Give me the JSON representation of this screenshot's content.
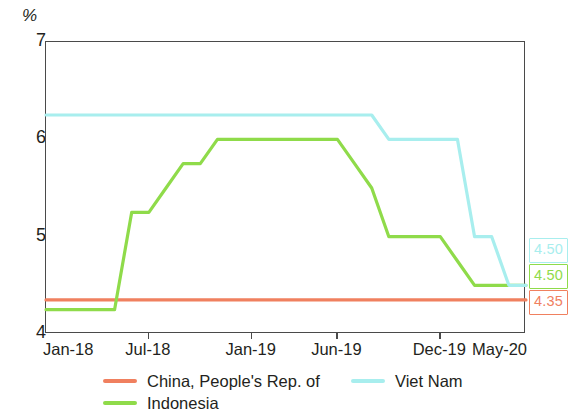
{
  "chart_data": {
    "type": "line",
    "title": "",
    "subtitle": "",
    "xlabel": "",
    "ylabel": "%",
    "unit_label": "%",
    "ylim": [
      4,
      7
    ],
    "yticks": [
      4,
      5,
      6,
      7
    ],
    "ytick_labels": [
      "4",
      "5",
      "6",
      "7"
    ],
    "grid": false,
    "legend_position": "bottom",
    "x": [
      "Jan-18",
      "Feb-18",
      "Mar-18",
      "Apr-18",
      "May-18",
      "Jun-18",
      "Jul-18",
      "Aug-18",
      "Sep-18",
      "Oct-18",
      "Nov-18",
      "Dec-18",
      "Jan-19",
      "Feb-19",
      "Mar-19",
      "Apr-19",
      "May-19",
      "Jun-19",
      "Jul-19",
      "Aug-19",
      "Sep-19",
      "Oct-19",
      "Nov-19",
      "Dec-19",
      "Jan-20",
      "Feb-20",
      "Mar-20",
      "Apr-20",
      "May-20"
    ],
    "xticks": [
      "Jan-18",
      "Jul-18",
      "Jan-19",
      "Jun-19",
      "Dec-19",
      "May-20"
    ],
    "xtick_indices": [
      0,
      6,
      12,
      17,
      23,
      28
    ],
    "series": [
      {
        "name": "China, People's Rep. of",
        "color": "#f0805f",
        "end_value": "4.35",
        "values": [
          4.35,
          4.35,
          4.35,
          4.35,
          4.35,
          4.35,
          4.35,
          4.35,
          4.35,
          4.35,
          4.35,
          4.35,
          4.35,
          4.35,
          4.35,
          4.35,
          4.35,
          4.35,
          4.35,
          4.35,
          4.35,
          4.35,
          4.35,
          4.35,
          4.35,
          4.35,
          4.35,
          4.35,
          4.35
        ]
      },
      {
        "name": "Indonesia",
        "color": "#8fdb4a",
        "end_value": "4.50",
        "values": [
          4.25,
          4.25,
          4.25,
          4.25,
          4.25,
          5.25,
          5.25,
          5.5,
          5.75,
          5.75,
          6.0,
          6.0,
          6.0,
          6.0,
          6.0,
          6.0,
          6.0,
          6.0,
          5.75,
          5.5,
          5.0,
          5.0,
          5.0,
          5.0,
          4.75,
          4.5,
          4.5,
          4.5,
          4.5
        ]
      },
      {
        "name": "Viet Nam",
        "color": "#a8eeee",
        "end_value": "4.50",
        "values": [
          6.25,
          6.25,
          6.25,
          6.25,
          6.25,
          6.25,
          6.25,
          6.25,
          6.25,
          6.25,
          6.25,
          6.25,
          6.25,
          6.25,
          6.25,
          6.25,
          6.25,
          6.25,
          6.25,
          6.25,
          6.0,
          6.0,
          6.0,
          6.0,
          6.0,
          5.0,
          5.0,
          4.5,
          4.5
        ]
      }
    ],
    "end_labels": [
      {
        "value": "4.50",
        "series": "Viet Nam",
        "color": "#a8eeee"
      },
      {
        "value": "4.50",
        "series": "Indonesia",
        "color": "#8fdb4a"
      },
      {
        "value": "4.35",
        "series": "China, People's Rep. of",
        "color": "#f0805f"
      }
    ],
    "legend": [
      {
        "label": "China, People's Rep. of",
        "color": "#f0805f"
      },
      {
        "label": "Indonesia",
        "color": "#8fdb4a"
      },
      {
        "label": "Viet Nam",
        "color": "#a8eeee"
      }
    ]
  }
}
